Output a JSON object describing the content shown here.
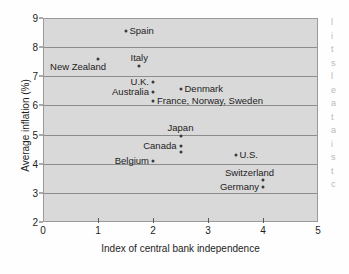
{
  "chart_data": {
    "type": "scatter",
    "title": "",
    "xlabel": "Index of central bank independence",
    "ylabel": "Average inflation (%)",
    "xlim": [
      0,
      5
    ],
    "ylim": [
      2,
      9
    ],
    "xticks": [
      "0",
      "1",
      "2",
      "3",
      "4",
      "5"
    ],
    "yticks": [
      "2",
      "3",
      "4",
      "5",
      "6",
      "7",
      "8",
      "9"
    ],
    "grid": "horizontal",
    "legend": "none",
    "points": [
      {
        "label": "Spain",
        "x": 1.5,
        "y": 8.55,
        "labelpos": "right"
      },
      {
        "label": "New Zealand",
        "x": 1.0,
        "y": 7.6,
        "labelpos": "below-left"
      },
      {
        "label": "Italy",
        "x": 1.75,
        "y": 7.35,
        "labelpos": "above"
      },
      {
        "label": "U.K.",
        "x": 2.0,
        "y": 6.8,
        "labelpos": "left"
      },
      {
        "label": "Denmark",
        "x": 2.5,
        "y": 6.55,
        "labelpos": "right"
      },
      {
        "label": "Australia",
        "x": 2.0,
        "y": 6.45,
        "labelpos": "left"
      },
      {
        "label": "France, Norway, Sweden",
        "x": 2.0,
        "y": 6.15,
        "labelpos": "right"
      },
      {
        "label": "Japan",
        "x": 2.5,
        "y": 4.95,
        "labelpos": "above"
      },
      {
        "label": "Canada",
        "x": 2.5,
        "y": 4.6,
        "labelpos": "left"
      },
      {
        "label": "",
        "x": 2.5,
        "y": 4.4,
        "labelpos": "none"
      },
      {
        "label": "U.S.",
        "x": 3.5,
        "y": 4.3,
        "labelpos": "right"
      },
      {
        "label": "Belgium",
        "x": 2.0,
        "y": 4.1,
        "labelpos": "left"
      },
      {
        "label": "Switzerland",
        "x": 4.0,
        "y": 3.45,
        "labelpos": "above-right"
      },
      {
        "label": "Germany",
        "x": 4.0,
        "y": 3.2,
        "labelpos": "left"
      }
    ],
    "colors": {
      "plot_background": "#d9d9d9",
      "gridline": "#8d8d8d",
      "marker": "#3a3a3a",
      "text": "#1d1d1d",
      "figure_background": "#fefefe"
    }
  },
  "margin_bleed": [
    "l",
    "i",
    "t",
    "s",
    "l",
    "",
    "e",
    "a",
    "t",
    "a",
    "i",
    "s",
    "",
    "t",
    "c"
  ]
}
